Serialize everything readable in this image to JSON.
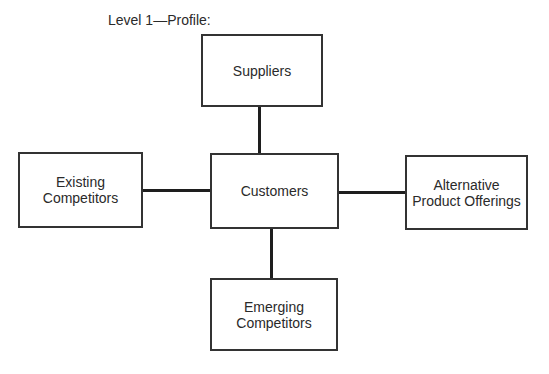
{
  "title": "Level 1—Profile:",
  "nodes": {
    "suppliers": {
      "line1": "Suppliers"
    },
    "existing": {
      "line1": "Existing",
      "line2": "Competitors"
    },
    "customers": {
      "line1": "Customers"
    },
    "alternative": {
      "line1": "Alternative",
      "line2": "Product Offerings"
    },
    "emerging": {
      "line1": "Emerging",
      "line2": "Competitors"
    }
  },
  "edges": [
    {
      "from": "customers",
      "to": "suppliers"
    },
    {
      "from": "customers",
      "to": "existing"
    },
    {
      "from": "customers",
      "to": "alternative"
    },
    {
      "from": "customers",
      "to": "emerging"
    }
  ]
}
